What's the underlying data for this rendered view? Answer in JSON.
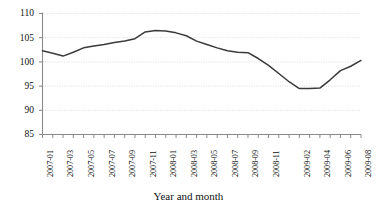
{
  "chart_data": {
    "type": "line",
    "title": "",
    "xlabel": "Year and month",
    "ylabel": "",
    "ylim": [
      85,
      110
    ],
    "yticks": [
      85,
      90,
      95,
      100,
      105,
      110
    ],
    "grid": true,
    "legend": false,
    "legend_position": "none",
    "line_color": "#3a3a3a",
    "grid_color": "#d9d9d9",
    "axis_color": "#8a8a8a",
    "x": [
      "2007-01",
      "2007-02",
      "2007-03",
      "2007-04",
      "2007-05",
      "2007-06",
      "2007-07",
      "2007-08",
      "2007-09",
      "2007-10",
      "2007-11",
      "2007-12",
      "2008-01",
      "2008-02",
      "2008-03",
      "2008-04",
      "2008-05",
      "2008-06",
      "2008-07",
      "2008-08",
      "2008-09",
      "2008-10",
      "2008-11",
      "2008-12",
      "2009-01",
      "2009-02",
      "2009-03",
      "2009-04",
      "2009-05",
      "2009-06",
      "2009-07",
      "2009-08"
    ],
    "xtick_labels": [
      "2007-01",
      "2007-03",
      "2007-05",
      "2007-07",
      "2007-09",
      "2007-11",
      "2008-01",
      "2008-03",
      "2008-05",
      "2008-07",
      "2008-09",
      "2008-11",
      "2009-02",
      "2009-04",
      "2009-06",
      "2009-08"
    ],
    "xtick_indices": [
      0,
      2,
      4,
      6,
      8,
      10,
      12,
      14,
      16,
      18,
      20,
      22,
      25,
      27,
      29,
      31
    ],
    "values": [
      102.3,
      101.8,
      101.2,
      102.0,
      102.9,
      103.3,
      103.6,
      104.0,
      104.3,
      104.8,
      106.2,
      106.5,
      106.4,
      106.0,
      105.4,
      104.3,
      103.6,
      102.9,
      102.3,
      102.0,
      101.9,
      100.7,
      99.3,
      97.6,
      95.9,
      94.5,
      94.5,
      94.6,
      96.3,
      98.2,
      99.1,
      100.3
    ]
  }
}
